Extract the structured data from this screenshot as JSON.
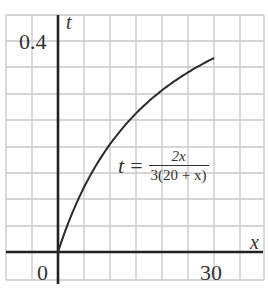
{
  "chart_data": {
    "type": "line",
    "title": "",
    "xlabel": "x",
    "ylabel": "t",
    "x_ticks": [
      "0",
      "30"
    ],
    "y_ticks": [
      "0.4"
    ],
    "xlim": [
      0,
      30
    ],
    "ylim": [
      0,
      0.4
    ],
    "grid": true,
    "legend": null,
    "annotation": {
      "lhs": "t",
      "eq": "=",
      "numerator": "2x",
      "denominator": "3(20 + x)"
    },
    "series": [
      {
        "name": "t = 2x / (3(20 + x))",
        "x": [
          0,
          2,
          4,
          6,
          8,
          10,
          12,
          14,
          16,
          18,
          20,
          22,
          24,
          26,
          28,
          30
        ],
        "y": [
          0,
          0.061,
          0.111,
          0.154,
          0.19,
          0.222,
          0.25,
          0.275,
          0.296,
          0.316,
          0.333,
          0.349,
          0.364,
          0.377,
          0.389,
          0.4
        ]
      }
    ]
  },
  "labels": {
    "y_tick": "0.4",
    "x_tick_0": "0",
    "x_tick_30": "30",
    "x_axis": "x",
    "y_axis": "t"
  },
  "colors": {
    "grid": "#c8c8c8",
    "axis": "#222222",
    "curve": "#2a2a2a",
    "text": "#333333"
  }
}
